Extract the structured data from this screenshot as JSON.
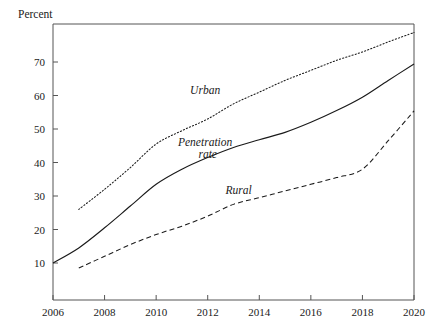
{
  "figure": {
    "y_axis_caption": "Percent",
    "background_text": {
      "line1": "",
      "line2": ""
    }
  },
  "chart_data": {
    "type": "line",
    "title": "",
    "subtitle": "",
    "xlabel": "",
    "ylabel": "Percent",
    "xlim": [
      2006,
      2020
    ],
    "ylim": [
      0,
      80
    ],
    "y_tick_labels": [
      "10",
      "20",
      "30",
      "40",
      "50",
      "60",
      "70"
    ],
    "y_ticks": [
      10,
      20,
      30,
      40,
      50,
      60,
      70
    ],
    "x_tick_labels": [
      "2006",
      "2008",
      "2010",
      "2012",
      "2014",
      "2016",
      "2018",
      "2020"
    ],
    "x_ticks": [
      2006,
      2008,
      2010,
      2012,
      2014,
      2016,
      2018,
      2020
    ],
    "grid": false,
    "legend": "inline-annotations",
    "annotations": [
      {
        "text": "Urban",
        "x": 2011.9,
        "y": 60.5,
        "style": "italic"
      },
      {
        "text": "Penetration",
        "x": 2011.9,
        "y": 45.0,
        "style": "italic"
      },
      {
        "text": "rate",
        "x": 2012.0,
        "y": 41.3,
        "style": "italic"
      },
      {
        "text": "Rural",
        "x": 2013.2,
        "y": 30.6,
        "style": "italic"
      }
    ],
    "series": [
      {
        "name": "Urban",
        "line_style": "dotted",
        "color": "#1a1a1a",
        "x": [
          2007,
          2008,
          2009,
          2010,
          2011,
          2012,
          2013,
          2014,
          2015,
          2016,
          2017,
          2018,
          2019,
          2020
        ],
        "values": [
          26.0,
          32.0,
          38.5,
          45.5,
          49.5,
          53.0,
          57.5,
          61.0,
          64.5,
          67.5,
          70.5,
          73.0,
          76.0,
          78.8
        ]
      },
      {
        "name": "Penetration rate",
        "line_style": "solid",
        "color": "#1a1a1a",
        "x": [
          2006,
          2007,
          2008,
          2009,
          2010,
          2011,
          2012,
          2013,
          2014,
          2015,
          2016,
          2017,
          2018,
          2019,
          2020
        ],
        "values": [
          10.0,
          14.5,
          20.5,
          27.0,
          33.5,
          38.0,
          41.5,
          44.5,
          46.8,
          49.0,
          52.0,
          55.5,
          59.5,
          64.5,
          69.4
        ]
      },
      {
        "name": "Rural",
        "line_style": "dashed",
        "color": "#1a1a1a",
        "x": [
          2007,
          2008,
          2009,
          2010,
          2011,
          2012,
          2013,
          2014,
          2015,
          2016,
          2017,
          2018,
          2019,
          2020
        ],
        "values": [
          8.5,
          12.0,
          15.5,
          18.5,
          21.0,
          24.0,
          27.5,
          29.5,
          31.5,
          33.5,
          35.5,
          38.0,
          46.5,
          55.4
        ]
      }
    ]
  }
}
